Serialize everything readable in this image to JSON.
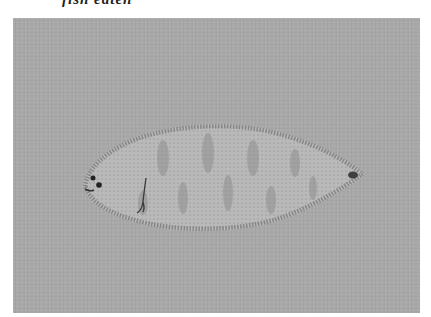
{
  "caption": {
    "text": "fish eaten"
  },
  "photo": {
    "subject": "flatfish (sole) specimen",
    "background_color": "#a9a9a9",
    "fish_body_color": "#b8b8b8",
    "fish_edge_color": "#7a7a7a",
    "mottle_color": "#8f8f8f"
  }
}
